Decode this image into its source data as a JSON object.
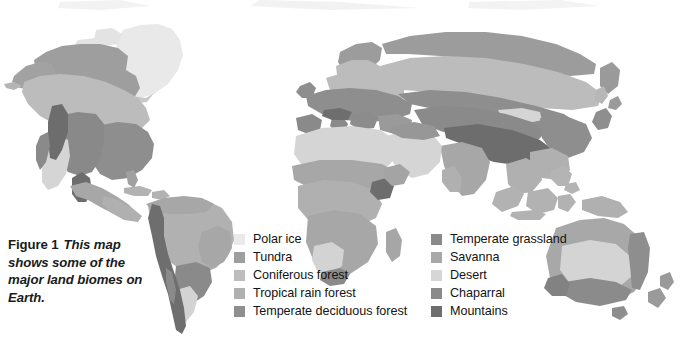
{
  "figure": {
    "label": "Figure 1",
    "caption": "This map shows some of the major land biomes on Earth.",
    "title": "This map shows some of the major land biomes on Earth."
  },
  "map": {
    "name": "world-biomes-map",
    "projection": "world",
    "background": "#ffffff",
    "regions_shown": [
      "North America",
      "South America",
      "Greenland",
      "Europe",
      "Africa",
      "Asia",
      "Southeast Asia",
      "Australia",
      "New Zealand"
    ]
  },
  "legend": {
    "columns": [
      {
        "name": "legend-column-left",
        "items": [
          {
            "label": "Polar ice",
            "color": "#eaeaea"
          },
          {
            "label": "Tundra",
            "color": "#9e9e9e"
          },
          {
            "label": "Coniferous forest",
            "color": "#bdbdbd"
          },
          {
            "label": "Tropical rain forest",
            "color": "#b0b0b0"
          },
          {
            "label": "Temperate deciduous forest",
            "color": "#8f8f8f"
          }
        ]
      },
      {
        "name": "legend-column-right",
        "items": [
          {
            "label": "Temperate grassland",
            "color": "#8a8a8a"
          },
          {
            "label": "Savanna",
            "color": "#a8a8a8"
          },
          {
            "label": "Desert",
            "color": "#d6d6d6"
          },
          {
            "label": "Chaparral",
            "color": "#8a8a8a"
          },
          {
            "label": "Mountains",
            "color": "#6e6e6e"
          }
        ]
      }
    ]
  },
  "palette": {
    "polar_ice": "#eaeaea",
    "tundra": "#9e9e9e",
    "coniferous_forest": "#bdbdbd",
    "tropical_rain_forest": "#b0b0b0",
    "temperate_deciduous_forest": "#8f8f8f",
    "temperate_grassland": "#8a8a8a",
    "savanna": "#a8a8a8",
    "desert": "#d6d6d6",
    "chaparral": "#8a8a8a",
    "mountains": "#6e6e6e",
    "page_background": "#ffffff",
    "text": "#131313"
  }
}
